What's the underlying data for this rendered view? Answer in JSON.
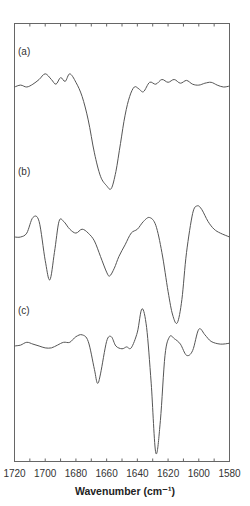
{
  "chart_data": {
    "type": "line",
    "title": "",
    "xlabel": "Wavenumber (cm⁻¹)",
    "ylabel": "",
    "xlim": [
      1720,
      1580
    ],
    "x_reversed": true,
    "x_ticks": [
      1720,
      1700,
      1680,
      1660,
      1640,
      1620,
      1600,
      1580
    ],
    "x_tick_labels": [
      "1720",
      "1700",
      "1680",
      "1660",
      "1640",
      "1620",
      "1600",
      "1580"
    ],
    "minor_tick_step": 10,
    "grid": false,
    "legend": null,
    "y_units": "arbitrary (stacked, offset traces)",
    "series": [
      {
        "name": "(a)",
        "label": "(a)",
        "x": [
          1720,
          1716,
          1712,
          1708,
          1704,
          1700,
          1696,
          1693,
          1690,
          1687,
          1684,
          1680,
          1676,
          1672,
          1668,
          1664,
          1660,
          1657,
          1654,
          1651,
          1648,
          1645,
          1642,
          1639,
          1636,
          1632,
          1628,
          1624,
          1620,
          1616,
          1612,
          1608,
          1604,
          1600,
          1596,
          1592,
          1588,
          1584,
          1580
        ],
        "y": [
          0.0,
          0.02,
          0.0,
          0.03,
          0.08,
          0.14,
          0.08,
          0.03,
          0.1,
          0.06,
          0.14,
          0.05,
          -0.1,
          -0.35,
          -0.7,
          -0.95,
          -1.05,
          -1.08,
          -0.9,
          -0.6,
          -0.3,
          -0.1,
          0.0,
          -0.02,
          -0.05,
          0.05,
          0.03,
          0.08,
          0.05,
          0.08,
          0.04,
          0.07,
          0.03,
          0.02,
          0.04,
          0.05,
          0.02,
          0.0,
          0.01
        ]
      },
      {
        "name": "(b)",
        "label": "(b)",
        "x": [
          1720,
          1716,
          1712,
          1708,
          1704,
          1700,
          1697,
          1694,
          1691,
          1688,
          1684,
          1680,
          1676,
          1672,
          1668,
          1664,
          1660,
          1658,
          1655,
          1652,
          1648,
          1644,
          1640,
          1636,
          1632,
          1628,
          1624,
          1620,
          1617,
          1614,
          1611,
          1608,
          1604,
          1601,
          1598,
          1594,
          1590,
          1586,
          1580
        ],
        "y": [
          0.0,
          0.0,
          0.05,
          0.25,
          0.2,
          -0.3,
          -0.55,
          -0.2,
          0.2,
          0.2,
          0.1,
          0.05,
          0.1,
          0.05,
          -0.05,
          -0.25,
          -0.45,
          -0.5,
          -0.4,
          -0.25,
          -0.1,
          0.05,
          0.1,
          0.2,
          0.25,
          0.15,
          -0.2,
          -0.7,
          -1.0,
          -1.1,
          -0.8,
          -0.2,
          0.3,
          0.4,
          0.35,
          0.2,
          0.1,
          0.05,
          0.0
        ]
      },
      {
        "name": "(c)",
        "label": "(c)",
        "x": [
          1720,
          1716,
          1712,
          1708,
          1704,
          1700,
          1696,
          1692,
          1688,
          1684,
          1680,
          1676,
          1672,
          1668,
          1666,
          1664,
          1660,
          1657,
          1654,
          1650,
          1647,
          1644,
          1640,
          1637,
          1634,
          1631,
          1628,
          1625,
          1622,
          1619,
          1616,
          1612,
          1608,
          1604,
          1600,
          1596,
          1592,
          1586,
          1580
        ],
        "y": [
          0.0,
          0.01,
          0.04,
          0.02,
          0.0,
          -0.02,
          -0.02,
          0.01,
          0.04,
          0.04,
          0.1,
          0.12,
          0.05,
          -0.25,
          -0.4,
          -0.3,
          0.05,
          0.1,
          0.0,
          -0.03,
          -0.01,
          -0.02,
          0.15,
          0.4,
          0.2,
          -0.4,
          -1.15,
          -0.8,
          -0.1,
          0.1,
          0.08,
          0.02,
          -0.1,
          -0.05,
          0.18,
          0.12,
          0.05,
          0.02,
          0.03
        ]
      }
    ],
    "annotations": [
      "(a)",
      "(b)",
      "(c)"
    ]
  }
}
